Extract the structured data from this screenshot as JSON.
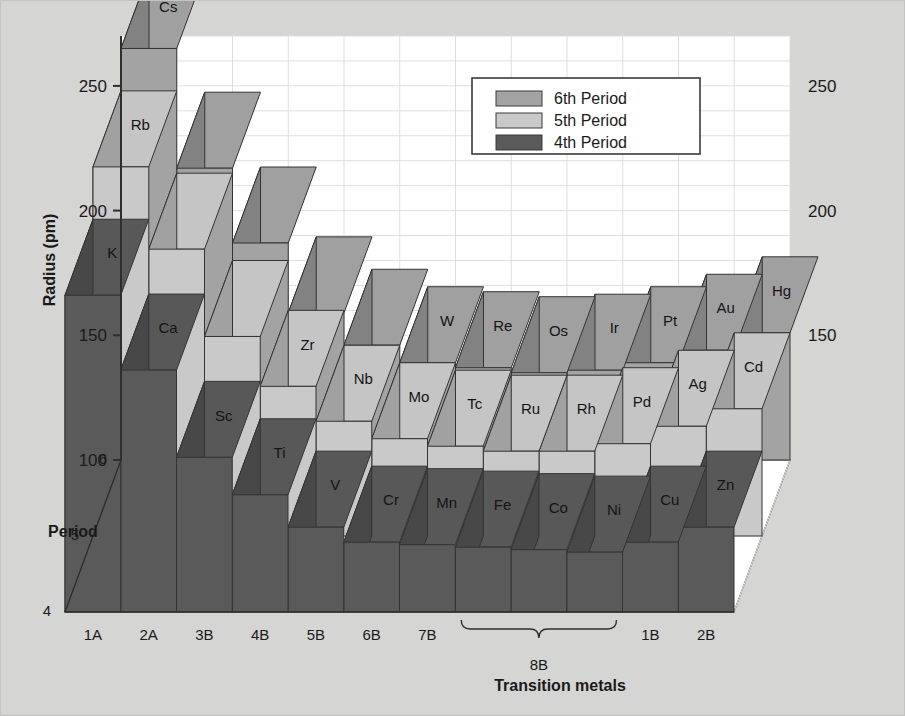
{
  "figure": {
    "background_color": "#d5d5d3",
    "plot_background_color": "#ffffff",
    "border_color": "#3a3a3a"
  },
  "axes": {
    "y_title": "Radius (pm)",
    "y_ticks_left": [
      "250",
      "200",
      "150",
      "100"
    ],
    "y_ticks_right": [
      "250",
      "200",
      "150"
    ],
    "x_title": "Transition metals",
    "x_ticks": [
      "1A",
      "2A",
      "3B",
      "4B",
      "5B",
      "6B",
      "7B",
      "1B",
      "2B"
    ],
    "x_group_brace_label": "8B",
    "depth_title": "Period",
    "depth_ticks": [
      "6",
      "5",
      "4"
    ]
  },
  "legend": {
    "entries": [
      {
        "label": "6th Period",
        "color": "#a3a3a3"
      },
      {
        "label": "5th Period",
        "color": "#c9c9c9"
      },
      {
        "label": "4th Period",
        "color": "#5a5a5a"
      }
    ]
  },
  "chart_data": {
    "type": "bar",
    "title": "",
    "subtitle": "",
    "xlabel": "Transition metals",
    "ylabel": "Radius (pm)",
    "ylim": [
      100,
      270
    ],
    "grid": true,
    "legend_position": "top-center-right",
    "projection": "3d",
    "categories": [
      "1A",
      "2A",
      "3B",
      "4B",
      "5B",
      "6B",
      "7B",
      "8B-1",
      "8B-2",
      "8B-3",
      "1B",
      "2B"
    ],
    "category_tick_labels": [
      "1A",
      "2A",
      "3B",
      "4B",
      "5B",
      "6B",
      "7B",
      "",
      "8B",
      "",
      "1B",
      "2B"
    ],
    "depth_categories": [
      "6",
      "5",
      "4"
    ],
    "series": [
      {
        "name": "6th Period",
        "color": "#a3a3a3",
        "element_labels": [
          "Cs",
          "Ba",
          "La",
          "Hf",
          "Ta",
          "W",
          "Re",
          "Os",
          "Ir",
          "Pt",
          "Au",
          "Hg"
        ],
        "visible_labels": [
          "Cs",
          "",
          "",
          "",
          "",
          "W",
          "Re",
          "Os",
          "Ir",
          "Pt",
          "Au",
          "Hg"
        ],
        "values": [
          265,
          217,
          187,
          159,
          146,
          139,
          137,
          135,
          136,
          139,
          144,
          151
        ]
      },
      {
        "name": "5th Period",
        "color": "#c9c9c9",
        "element_labels": [
          "Rb",
          "Sr",
          "Y",
          "Zr",
          "Nb",
          "Mo",
          "Tc",
          "Ru",
          "Rh",
          "Pd",
          "Ag",
          "Cd"
        ],
        "visible_labels": [
          "Rb",
          "",
          "",
          "Zr",
          "Nb",
          "Mo",
          "Tc",
          "Ru",
          "Rh",
          "Pd",
          "Ag",
          "Cd"
        ],
        "values": [
          248,
          215,
          180,
          160,
          146,
          139,
          136,
          134,
          134,
          137,
          144,
          151
        ]
      },
      {
        "name": "4th Period",
        "color": "#5a5a5a",
        "element_labels": [
          "K",
          "Ca",
          "Sc",
          "Ti",
          "V",
          "Cr",
          "Mn",
          "Fe",
          "Co",
          "Ni",
          "Cu",
          "Zn"
        ],
        "visible_labels": [
          "K",
          "Ca",
          "Sc",
          "Ti",
          "V",
          "Cr",
          "Mn",
          "Fe",
          "Co",
          "Ni",
          "Cu",
          "Zn"
        ],
        "values": [
          227,
          197,
          162,
          147,
          134,
          128,
          127,
          126,
          125,
          124,
          128,
          134
        ]
      }
    ]
  }
}
